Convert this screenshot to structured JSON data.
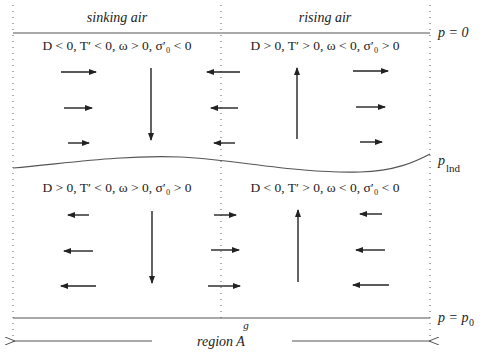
{
  "columns": {
    "left_title": "sinking air",
    "right_title": "rising air"
  },
  "conditions": {
    "upper_left": "D < 0,  T′ < 0,  ω > 0,  σ′₀ < 0",
    "upper_right": "D > 0,  T′ > 0,  ω < 0,  σ′₀ > 0",
    "lower_left": "D > 0,  T′ < 0,  ω > 0,  σ′₀ > 0",
    "lower_right": "D < 0,  T′ > 0,  ω < 0,  σ′₀ < 0"
  },
  "levels": {
    "top": "p = 0",
    "lnd_p": "p",
    "lnd_sub": "lnd",
    "bottom_p": "p = p",
    "bottom_sub": "0"
  },
  "bottom": {
    "g_label": "g",
    "region_label": "region  A"
  },
  "colors": {
    "line": "#555555",
    "arrow": "#222222",
    "dotted": "#777777"
  }
}
